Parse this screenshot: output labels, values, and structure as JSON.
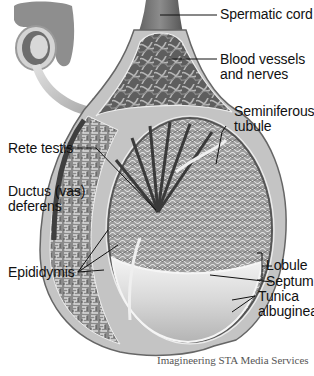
{
  "diagram": {
    "inset": "external view with arrow pointing to cross-section",
    "labels": {
      "spermatic_cord": "Spermatic cord",
      "blood_vessels_1": "Blood vessels",
      "blood_vessels_2": "and nerves",
      "seminiferous_1": "Seminiferous",
      "seminiferous_2": "tubule",
      "rete_testis": "Rete testis",
      "ductus_1": "Ductus (vas)",
      "ductus_2": "deferens",
      "lobule": "Lobule",
      "septum": "Septum",
      "tunica_1": "Tunica",
      "tunica_2": "albuginea",
      "epididymis": "Epididymis"
    },
    "credit": "Imagineering STA Media Services",
    "colors": {
      "background": "#ffffff",
      "tissue_dark": "#5a5a5a",
      "tissue_mid": "#9a9a9a",
      "tissue_light": "#d6d6d6",
      "leader_line": "#111111"
    }
  }
}
